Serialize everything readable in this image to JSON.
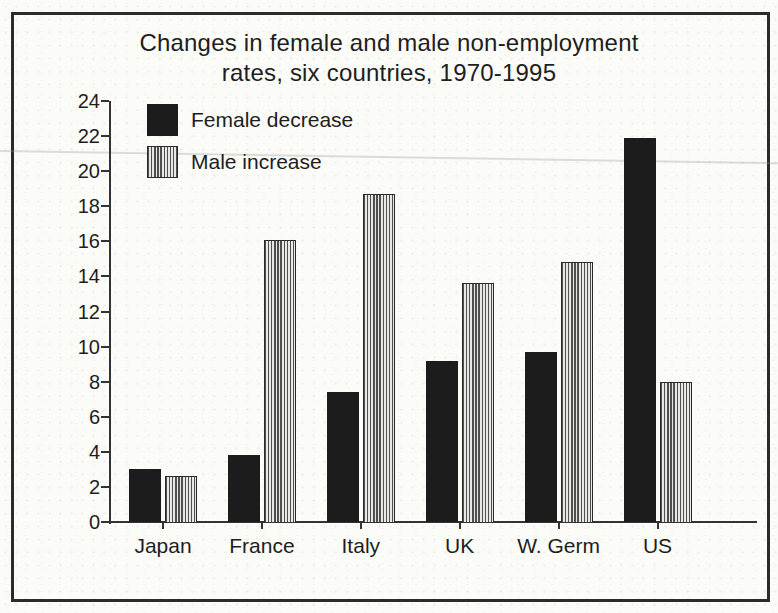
{
  "title": {
    "line1": "Changes in female and male non-employment",
    "line2": "rates, six countries, 1970-1995"
  },
  "legend": [
    {
      "label": "Female decrease",
      "swatch": "solid-black-square"
    },
    {
      "label": "Male increase",
      "swatch": "vertical-striped-square"
    }
  ],
  "chart_data": {
    "type": "bar",
    "title": "Changes in female and male non-employment rates, six countries, 1970-1995",
    "categories": [
      "Japan",
      "France",
      "Italy",
      "UK",
      "W. Germ",
      "US"
    ],
    "series": [
      {
        "name": "Female decrease",
        "style": "solid",
        "values": [
          3.0,
          3.8,
          7.4,
          9.2,
          9.7,
          21.9
        ]
      },
      {
        "name": "Male increase",
        "style": "striped",
        "values": [
          2.6,
          16.1,
          18.7,
          13.6,
          14.8,
          8.0
        ]
      }
    ],
    "ylim": [
      0,
      24
    ],
    "ytick_step": 2,
    "yticks": [
      0,
      2,
      4,
      6,
      8,
      10,
      12,
      14,
      16,
      18,
      20,
      22,
      24
    ],
    "grid": false,
    "legend_position": "top-left"
  },
  "colors": {
    "bar_black": "#1c1c1c",
    "stripe_dark": "#4f4f4f",
    "stripe_light": "#e8e8e4",
    "axis": "#333333",
    "frame": "#2b2b2b",
    "paper": "#fbfbf8",
    "text": "#1e1e1e"
  }
}
